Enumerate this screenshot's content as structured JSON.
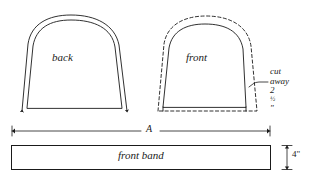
{
  "figure": {
    "background_color": "#ffffff",
    "line_color": "#1a1a1a",
    "pieces": [
      {
        "id": "back",
        "label": "back",
        "outline_style": "solid",
        "has_seam_allowance_outline": true,
        "seam_outline_style": "solid",
        "arrow_markers": 2
      },
      {
        "id": "front",
        "label": "front",
        "outline_style": "solid",
        "has_seam_allowance_outline": true,
        "seam_outline_style": "dashed",
        "arrow_markers": 0
      }
    ],
    "annotations": [
      {
        "id": "cut-away",
        "line1": "cut",
        "line2": "away",
        "line3_value": "2",
        "line3_fraction": "1/2",
        "line3_unit": "\"",
        "line3_full": "2 1/2\"",
        "leader": true
      }
    ],
    "dimensions": [
      {
        "id": "width-a",
        "label": "A",
        "orientation": "horizontal",
        "arrowheads": "both"
      },
      {
        "id": "band-height",
        "label": "4\"",
        "orientation": "vertical",
        "arrowheads": "both"
      }
    ],
    "band": {
      "id": "front-band",
      "label": "front band",
      "shape": "rectangle",
      "outline_style": "solid"
    }
  }
}
